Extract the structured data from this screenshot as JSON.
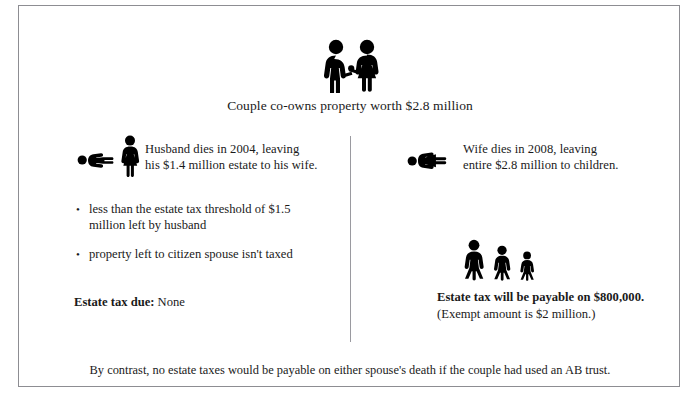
{
  "diagram": {
    "title_caption": "Couple co-owns property worth $2.8 million",
    "footnote": "By contrast, no estate taxes would be payable on either spouse's death if the couple had used an AB trust.",
    "accent_color": "#000000",
    "border_color": "#8d8d92",
    "background_color": "#ffffff"
  },
  "left_branch": {
    "event_text_line1": "Husband dies in 2004, leaving",
    "event_text_line2": "his $1.4 million estate to his wife.",
    "bullets": [
      "less than the estate tax threshold of $1.5 million left by husband",
      "property left to citizen spouse isn't taxed"
    ],
    "result_label": "Estate tax due:",
    "result_value": "None",
    "icons": {
      "fallen": "fallen-man-icon",
      "standing": "standing-woman-icon"
    }
  },
  "right_branch": {
    "event_text_line1": "Wife dies in 2008, leaving",
    "event_text_line2": "entire $2.8 million to children.",
    "result_line1": "Estate tax will be payable on $800,000.",
    "result_line2": "(Exempt amount is $2 million.)",
    "icons": {
      "fallen": "fallen-woman-icon",
      "heirs": "three-children-icon"
    }
  },
  "icons": {
    "couple": "couple-holding-hands-icon",
    "divider": "vertical-divider"
  }
}
